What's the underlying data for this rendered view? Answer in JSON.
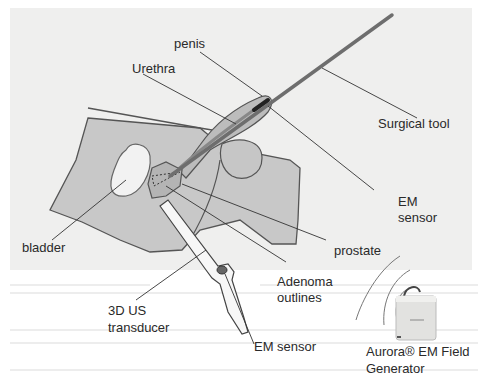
{
  "diagram": {
    "type": "anatomical-schematic",
    "labels": {
      "penis": "penis",
      "urethra": "Urethra",
      "surgical_tool": "Surgical tool",
      "em_sensor_tool_line1": "EM",
      "em_sensor_tool_line2": "sensor",
      "bladder": "bladder",
      "prostate": "prostate",
      "adenoma_line1": "Adenoma",
      "adenoma_line2": "outlines",
      "us_transducer_line1": "3D US",
      "us_transducer_line2": "transducer",
      "em_sensor_probe": "EM sensor",
      "field_generator_line1": "Aurora® EM Field",
      "field_generator_line2": "Generator"
    },
    "colors": {
      "background_panel": "#efefee",
      "tissue_fill": "#c8c8c8",
      "organ_outline": "#555555",
      "bladder_fill": "#f2f2f2",
      "prostate_fill": "#b4b4b4",
      "tool": "#6e6e6e",
      "leader_line": "#333333",
      "label_text": "#2a2a2a",
      "probe_fill": "#f7f7f7",
      "device_fill": "#e2e2e0"
    }
  }
}
